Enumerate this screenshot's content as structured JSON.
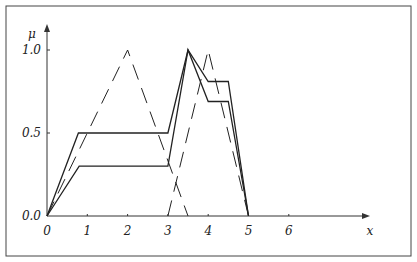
{
  "chart_data": {
    "type": "line",
    "title": "",
    "xlabel": "x",
    "ylabel": "μ",
    "xlim": [
      0,
      8
    ],
    "ylim": [
      0,
      1.0
    ],
    "x_ticks": [
      "0",
      "1",
      "2",
      "3",
      "4",
      "5",
      "6"
    ],
    "y_ticks": [
      "0.0",
      "0.5",
      "1.0"
    ],
    "grid": false,
    "legend": null,
    "series": [
      {
        "name": "upper solid",
        "style": "solid",
        "points": [
          [
            0,
            0
          ],
          [
            0.78,
            0.5
          ],
          [
            3,
            0.5
          ],
          [
            3.5,
            1.0
          ],
          [
            4,
            0.81
          ],
          [
            4.5,
            0.81
          ],
          [
            5,
            0
          ]
        ]
      },
      {
        "name": "lower solid",
        "style": "solid",
        "points": [
          [
            0,
            0
          ],
          [
            0.8,
            0.3
          ],
          [
            3,
            0.3
          ],
          [
            3.5,
            1.0
          ],
          [
            4,
            0.69
          ],
          [
            4.5,
            0.69
          ],
          [
            5,
            0
          ]
        ]
      },
      {
        "name": "dashed triangle A",
        "style": "dashed",
        "points": [
          [
            0,
            0
          ],
          [
            2,
            1.0
          ],
          [
            3.5,
            0
          ]
        ]
      },
      {
        "name": "dashed triangle B",
        "style": "dashed",
        "points": [
          [
            3,
            0
          ],
          [
            4,
            1.0
          ],
          [
            5,
            0
          ]
        ]
      }
    ]
  }
}
